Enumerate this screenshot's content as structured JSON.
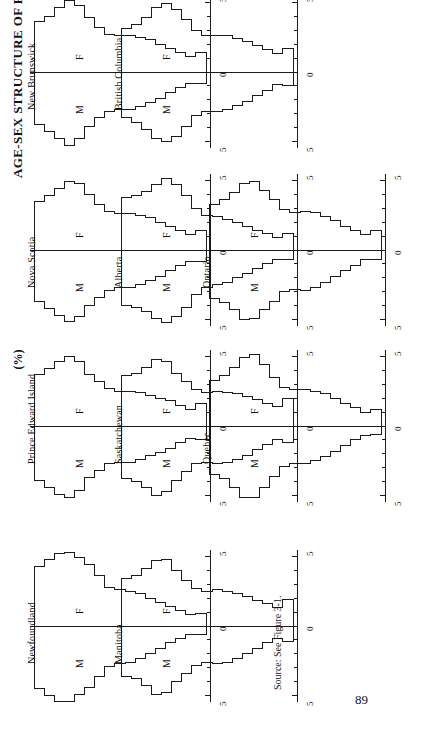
{
  "figure": {
    "title": "AGE-SEX STRUCTURE OF PROVINCIAL POPULATIONS, 1979",
    "unit_label": "(%)",
    "source": "Source: See Figure 3-1.",
    "page_number": "89"
  },
  "axis": {
    "left_label": "5",
    "center_label": "0",
    "right_label": "5",
    "female_label": "F",
    "male_label": "M",
    "tick_values": [
      5,
      4,
      3,
      2,
      1,
      0,
      1,
      2,
      3,
      4,
      5
    ]
  },
  "chart_data": {
    "type": "bar",
    "title": "AGE-SEX STRUCTURE OF PROVINCIAL POPULATIONS, 1979",
    "xlabel": "(%)",
    "ylabel": "Age group",
    "xlim": [
      -5.5,
      5.5
    ],
    "grid": false,
    "legend": [
      "F",
      "M"
    ],
    "note": "Population pyramids, percent of provincial population by 5-year age group; female (F) to the right of 0, male (M) to the left.",
    "categories": [
      "0-4",
      "5-9",
      "10-14",
      "15-19",
      "20-24",
      "25-29",
      "30-34",
      "35-39",
      "40-44",
      "45-49",
      "50-54",
      "55-59",
      "60-64",
      "65-69",
      "70-74",
      "75-79",
      "80+"
    ],
    "panels": [
      {
        "name": "Newfoundland",
        "series": [
          {
            "name": "F",
            "values": [
              4.3,
              4.8,
              5.2,
              5.3,
              4.9,
              4.4,
              3.6,
              2.8,
              2.6,
              2.5,
              2.3,
              2.0,
              1.7,
              1.4,
              1.1,
              0.8,
              0.9
            ]
          },
          {
            "name": "M",
            "values": [
              4.5,
              5.0,
              5.4,
              5.4,
              4.9,
              4.4,
              3.6,
              2.9,
              2.7,
              2.6,
              2.3,
              2.0,
              1.6,
              1.2,
              0.9,
              0.6,
              0.6
            ]
          }
        ]
      },
      {
        "name": "Prince Edward Island",
        "series": [
          {
            "name": "F",
            "values": [
              3.7,
              4.1,
              4.6,
              5.0,
              4.6,
              3.7,
              3.2,
              2.7,
              2.5,
              2.5,
              2.4,
              2.2,
              2.0,
              1.8,
              1.5,
              1.2,
              1.6
            ]
          },
          {
            "name": "M",
            "values": [
              3.9,
              4.4,
              4.9,
              5.1,
              4.6,
              3.7,
              3.2,
              2.7,
              2.6,
              2.6,
              2.4,
              2.1,
              1.9,
              1.6,
              1.2,
              0.9,
              1.0
            ]
          }
        ]
      },
      {
        "name": "Nova Scotia",
        "series": [
          {
            "name": "F",
            "values": [
              3.5,
              3.9,
              4.4,
              4.9,
              4.8,
              4.0,
              3.3,
              2.8,
              2.6,
              2.6,
              2.5,
              2.3,
              2.0,
              1.7,
              1.4,
              1.1,
              1.4
            ]
          },
          {
            "name": "M",
            "values": [
              3.7,
              4.2,
              4.7,
              5.1,
              4.8,
              4.0,
              3.4,
              2.9,
              2.7,
              2.7,
              2.5,
              2.2,
              1.9,
              1.5,
              1.1,
              0.8,
              0.8
            ]
          }
        ]
      },
      {
        "name": "New Brunswick",
        "series": [
          {
            "name": "F",
            "values": [
              3.6,
              4.0,
              4.6,
              5.1,
              4.8,
              3.9,
              3.2,
              2.7,
              2.6,
              2.6,
              2.5,
              2.3,
              2.0,
              1.7,
              1.4,
              1.1,
              1.4
            ]
          },
          {
            "name": "M",
            "values": [
              3.8,
              4.3,
              4.8,
              5.3,
              4.8,
              3.9,
              3.3,
              2.8,
              2.7,
              2.7,
              2.5,
              2.2,
              1.9,
              1.5,
              1.1,
              0.8,
              0.8
            ]
          }
        ]
      },
      {
        "name": "Quebec",
        "series": [
          {
            "name": "F",
            "values": [
              3.3,
              3.6,
              4.2,
              4.9,
              5.1,
              4.4,
              3.5,
              2.8,
              2.6,
              2.6,
              2.5,
              2.3,
              2.0,
              1.6,
              1.3,
              1.0,
              1.2
            ]
          },
          {
            "name": "M",
            "values": [
              3.5,
              3.8,
              4.4,
              5.1,
              5.1,
              4.4,
              3.6,
              2.9,
              2.7,
              2.7,
              2.5,
              2.2,
              1.8,
              1.4,
              1.0,
              0.7,
              0.6
            ]
          }
        ]
      },
      {
        "name": "Ontario",
        "series": [
          {
            "name": "F",
            "values": [
              3.3,
              3.6,
              4.1,
              4.8,
              4.9,
              4.3,
              3.6,
              2.9,
              2.7,
              2.8,
              2.7,
              2.4,
              2.1,
              1.7,
              1.4,
              1.1,
              1.4
            ]
          },
          {
            "name": "M",
            "values": [
              3.5,
              3.8,
              4.3,
              5.0,
              4.9,
              4.3,
              3.7,
              3.0,
              2.8,
              2.9,
              2.7,
              2.3,
              1.9,
              1.5,
              1.1,
              0.7,
              0.7
            ]
          }
        ]
      },
      {
        "name": "Manitoba",
        "series": [
          {
            "name": "F",
            "values": [
              3.4,
              3.6,
              4.1,
              4.7,
              4.8,
              4.0,
              3.3,
              2.7,
              2.5,
              2.6,
              2.5,
              2.3,
              2.1,
              1.8,
              1.6,
              1.3,
              1.9
            ]
          },
          {
            "name": "M",
            "values": [
              3.6,
              3.8,
              4.3,
              4.9,
              4.8,
              4.0,
              3.4,
              2.8,
              2.6,
              2.7,
              2.6,
              2.3,
              2.0,
              1.6,
              1.2,
              0.9,
              1.1
            ]
          }
        ]
      },
      {
        "name": "Saskatchewan",
        "series": [
          {
            "name": "F",
            "values": [
              3.6,
              3.8,
              4.2,
              4.8,
              4.6,
              3.8,
              3.2,
              2.6,
              2.4,
              2.5,
              2.4,
              2.3,
              2.1,
              1.9,
              1.6,
              1.4,
              2.0
            ]
          },
          {
            "name": "M",
            "values": [
              3.8,
              4.0,
              4.4,
              5.0,
              4.7,
              3.9,
              3.3,
              2.7,
              2.6,
              2.7,
              2.6,
              2.4,
              2.1,
              1.7,
              1.3,
              1.0,
              1.2
            ]
          }
        ]
      },
      {
        "name": "Alberta",
        "series": [
          {
            "name": "F",
            "values": [
              3.8,
              3.9,
              4.2,
              4.7,
              5.1,
              4.7,
              3.9,
              3.0,
              2.5,
              2.4,
              2.2,
              2.0,
              1.7,
              1.4,
              1.2,
              0.9,
              1.2
            ]
          },
          {
            "name": "M",
            "values": [
              4.0,
              4.1,
              4.4,
              4.9,
              5.2,
              4.8,
              4.1,
              3.2,
              2.7,
              2.5,
              2.3,
              2.0,
              1.7,
              1.3,
              1.0,
              0.7,
              0.7
            ]
          }
        ]
      },
      {
        "name": "British Columbia",
        "series": [
          {
            "name": "F",
            "values": [
              3.1,
              3.4,
              3.9,
              4.6,
              4.9,
              4.5,
              3.8,
              3.0,
              2.6,
              2.6,
              2.6,
              2.4,
              2.2,
              1.9,
              1.6,
              1.3,
              1.7
            ]
          },
          {
            "name": "M",
            "values": [
              3.3,
              3.6,
              4.1,
              4.8,
              5.0,
              4.6,
              3.9,
              3.1,
              2.8,
              2.8,
              2.7,
              2.4,
              2.1,
              1.7,
              1.3,
              0.9,
              1.0
            ]
          }
        ]
      }
    ]
  }
}
